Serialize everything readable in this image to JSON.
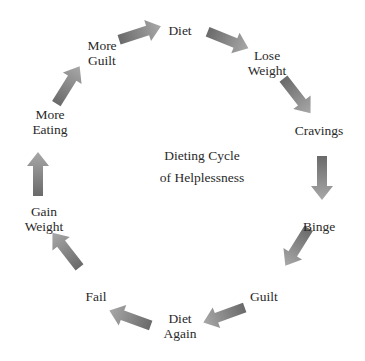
{
  "title": {
    "line1": "Dieting Cycle",
    "line2": "of Helplessness"
  },
  "nodes": [
    {
      "id": "diet",
      "line1": "Diet",
      "line2": ""
    },
    {
      "id": "lose-weight",
      "line1": "Lose",
      "line2": "Weight"
    },
    {
      "id": "cravings",
      "line1": "Cravings",
      "line2": ""
    },
    {
      "id": "binge",
      "line1": "Binge",
      "line2": ""
    },
    {
      "id": "guilt",
      "line1": "Guilt",
      "line2": ""
    },
    {
      "id": "diet-again",
      "line1": "Diet",
      "line2": "Again"
    },
    {
      "id": "fail",
      "line1": "Fail",
      "line2": ""
    },
    {
      "id": "gain-weight",
      "line1": "Gain",
      "line2": "Weight"
    },
    {
      "id": "more-eating",
      "line1": "More",
      "line2": "Eating"
    },
    {
      "id": "more-guilt",
      "line1": "More",
      "line2": "Guilt"
    }
  ],
  "colors": {
    "arrow_dark": "#6f6f6f",
    "arrow_light": "#a9a9a9",
    "text": "#2a2a2a",
    "background": "#ffffff"
  }
}
